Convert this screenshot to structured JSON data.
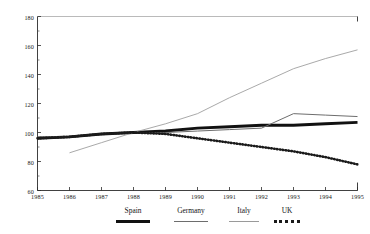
{
  "chart_data": {
    "type": "line",
    "title": "",
    "xlabel": "",
    "ylabel": "",
    "xlim": [
      1985,
      1995
    ],
    "ylim": [
      60,
      180
    ],
    "grid": false,
    "legend_position": "bottom",
    "x": [
      1985,
      1986,
      1987,
      1988,
      1989,
      1990,
      1991,
      1992,
      1993,
      1994,
      1995
    ],
    "yticks": [
      60,
      80,
      100,
      120,
      140,
      160,
      180
    ],
    "ytick_labels": [
      "60",
      "80",
      "100",
      "120",
      "140",
      "160",
      "180"
    ],
    "xticks": [
      1985,
      1986,
      1987,
      1988,
      1989,
      1990,
      1991,
      1992,
      1993,
      1994,
      1995
    ],
    "xtick_labels": [
      "1985",
      "1986",
      "1987",
      "1988",
      "1989",
      "1990",
      "1991",
      "1992",
      "1993",
      "1994",
      "1995"
    ],
    "series": [
      {
        "name": "Spain",
        "style": "thick-solid",
        "color": "#111111",
        "x": [
          1985,
          1986,
          1987,
          1988,
          1989,
          1990,
          1991,
          1992,
          1993,
          1994,
          1995
        ],
        "values": [
          96,
          97,
          99,
          100,
          101,
          103,
          104,
          105,
          105,
          106,
          107
        ]
      },
      {
        "name": "Germany",
        "style": "thin-solid",
        "color": "#6d6d6d",
        "x": [
          1985,
          1986,
          1987,
          1988,
          1989,
          1990,
          1991,
          1992,
          1993,
          1994,
          1995
        ],
        "values": [
          97,
          97,
          99,
          100,
          100,
          101,
          102,
          103,
          113,
          112,
          111
        ]
      },
      {
        "name": "Italy",
        "style": "thin-light-solid",
        "color": "#9a9a9a",
        "x": [
          1986,
          1987,
          1988,
          1989,
          1990,
          1991,
          1992,
          1993,
          1994,
          1995
        ],
        "values": [
          86,
          93,
          100,
          106,
          113,
          124,
          134,
          144,
          151,
          157
        ]
      },
      {
        "name": "UK",
        "style": "dotted",
        "color": "#1a1a1a",
        "x": [
          1985,
          1986,
          1987,
          1988,
          1989,
          1990,
          1991,
          1992,
          1993,
          1994,
          1995
        ],
        "values": [
          96,
          97,
          99,
          100,
          99,
          96,
          93,
          90,
          87,
          83,
          78
        ]
      }
    ]
  },
  "legend": {
    "items": [
      {
        "label": "Spain"
      },
      {
        "label": "Germany"
      },
      {
        "label": "Italy"
      },
      {
        "label": "UK"
      }
    ]
  }
}
